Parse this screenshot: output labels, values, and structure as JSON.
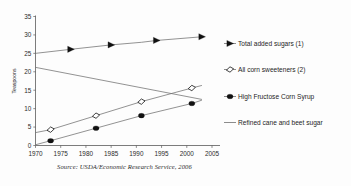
{
  "figure": {
    "source_note": "Source: USDA/Economic Research Service, 2006"
  },
  "chart_data": {
    "type": "line",
    "title": "",
    "xlabel": "",
    "ylabel": "Teaspoons",
    "xlim": [
      1970,
      2005
    ],
    "ylim": [
      0,
      35
    ],
    "xticks": [
      1970,
      1975,
      1980,
      1985,
      1990,
      1995,
      2000,
      2005
    ],
    "xtick_labels": [
      "1970",
      "1975",
      "1980",
      "1985",
      "1990",
      "1995",
      "2000",
      "2005"
    ],
    "yticks": [
      0,
      5,
      10,
      15,
      20,
      25,
      30,
      35
    ],
    "ytick_labels": [
      "0",
      "5",
      "10",
      "15",
      "20",
      "25",
      "30",
      "35"
    ],
    "grid": false,
    "legend_position": "right",
    "series": [
      {
        "name": "Total added sugars (1)",
        "marker": "right-triangle-filled",
        "x": [
          1970,
          1977,
          1985,
          1991,
          1994,
          2003
        ],
        "values": [
          25.0,
          26.1,
          27.3,
          28.0,
          28.5,
          29.5
        ],
        "marker_x": [
          1977,
          1985,
          1994,
          2003
        ],
        "marker_values": [
          26.1,
          27.3,
          28.5,
          29.5
        ]
      },
      {
        "name": "All corn sweeteners (2)",
        "marker": "open-diamond",
        "x": [
          1970,
          1973,
          1982,
          1991,
          2001,
          2003
        ],
        "values": [
          3.5,
          4.3,
          8.1,
          11.9,
          15.6,
          16.3
        ],
        "marker_x": [
          1973,
          1982,
          1991,
          2001
        ],
        "marker_values": [
          4.3,
          8.1,
          11.9,
          15.6
        ]
      },
      {
        "name": "High Fructose Corn Syrup",
        "marker": "filled-circle",
        "x": [
          1970,
          1973,
          1982,
          1991,
          2001,
          2003
        ],
        "values": [
          0.2,
          1.3,
          4.7,
          8.1,
          11.4,
          12.3
        ],
        "marker_x": [
          1973,
          1982,
          1991,
          2001
        ],
        "marker_values": [
          1.3,
          4.7,
          8.1,
          11.4
        ]
      },
      {
        "name": "Refined cane and beet sugar",
        "marker": "none",
        "x": [
          1970,
          2003
        ],
        "values": [
          21.2,
          12.5
        ],
        "marker_x": [],
        "marker_values": []
      }
    ],
    "legend": [
      {
        "label": "Total added sugars (1)",
        "marker": "right-triangle-filled"
      },
      {
        "label": "All corn sweeteners (2)",
        "marker": "open-diamond"
      },
      {
        "label": "High Fructose Corn Syrup",
        "marker": "filled-circle"
      },
      {
        "label": "Refined cane and beet sugar",
        "marker": "none"
      }
    ],
    "colors": {
      "line": "#6f6f6f",
      "marker": "#111111",
      "axis": "#5a5a5a",
      "text": "#1d1d1d",
      "background": "#fdfdfd"
    }
  }
}
